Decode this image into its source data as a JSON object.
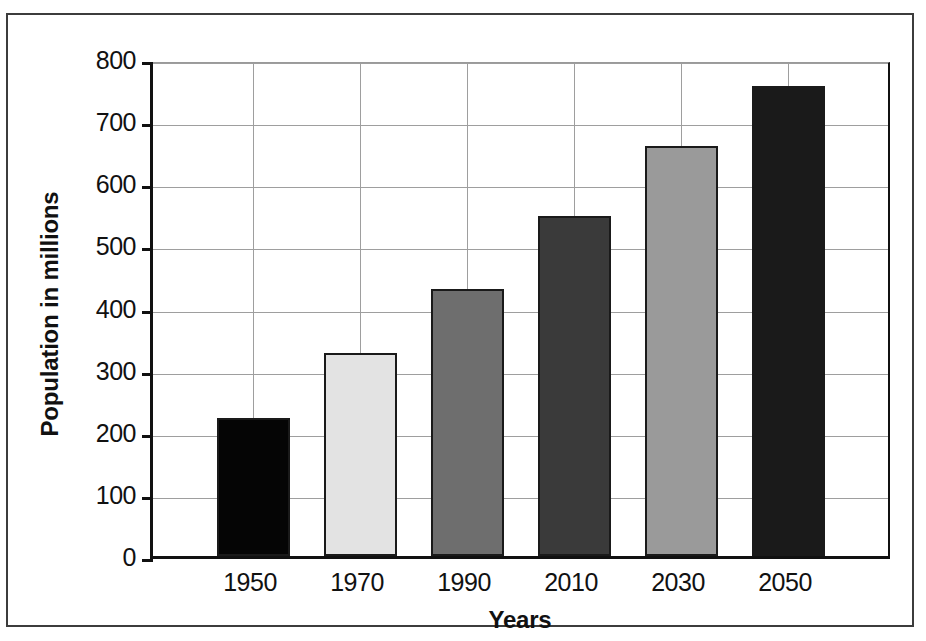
{
  "chart_data": {
    "type": "bar",
    "title": "",
    "subtitle": "",
    "xlabel": "Years",
    "ylabel": "Population in millions",
    "categories": [
      "1950",
      "1970",
      "1990",
      "2010",
      "2030",
      "2050"
    ],
    "values": [
      222,
      327,
      430,
      547,
      660,
      757
    ],
    "series": [
      {
        "name": "Population",
        "values": [
          222,
          327,
          430,
          547,
          660,
          757
        ]
      }
    ],
    "ylim": [
      0,
      800
    ],
    "ytick_labels": [
      "800",
      "700",
      "600",
      "500",
      "400",
      "300",
      "200",
      "100",
      "0"
    ],
    "ytick_values": [
      800,
      700,
      600,
      500,
      400,
      300,
      200,
      100,
      0
    ],
    "grid": "horizontal-and-vertical",
    "legend": "none",
    "bar_colors": [
      "#050505",
      "#e3e3e3",
      "#6e6e6e",
      "#3a3a3a",
      "#9a9a9a",
      "#1a1a1a"
    ],
    "bar_border_color": "#1a1a1a",
    "gridline_color": "#9e9e9e",
    "axis_color": "#111111",
    "background_color": "#ffffff"
  },
  "frame": {
    "border_color": "#3c3c3c"
  }
}
